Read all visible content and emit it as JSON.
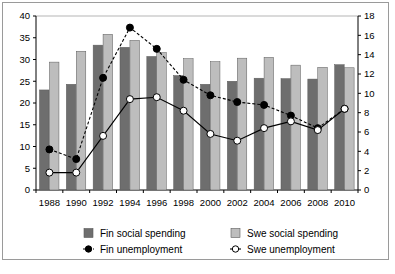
{
  "chart_data": {
    "type": "bar",
    "title": "",
    "subtitle": "",
    "xlabel": "",
    "ylabel": "",
    "y2label": "",
    "grid": false,
    "legend_position": "bottom",
    "categories": [
      "1988",
      "1990",
      "1992",
      "1994",
      "1996",
      "1998",
      "2000",
      "2002",
      "2004",
      "2006",
      "2008",
      "2010"
    ],
    "x_tick_labels": [
      "1988",
      "1990",
      "1992",
      "1994",
      "1996",
      "1998",
      "2000",
      "2002",
      "2004",
      "2006",
      "2008",
      "2010"
    ],
    "ylim": [
      0,
      40
    ],
    "y_ticks": [
      0,
      5,
      10,
      15,
      20,
      25,
      30,
      35,
      40
    ],
    "y_tick_labels": [
      "0",
      "5",
      "10",
      "15",
      "20",
      "25",
      "30",
      "35",
      "40"
    ],
    "y2lim": [
      0,
      18
    ],
    "y2_ticks": [
      0,
      2,
      4,
      6,
      8,
      10,
      12,
      14,
      16,
      18
    ],
    "y2_tick_labels": [
      "0",
      "2",
      "4",
      "6",
      "8",
      "10",
      "12",
      "14",
      "16",
      "18"
    ],
    "series": [
      {
        "name": "Fin social spending",
        "kind": "bar",
        "axis": "left",
        "color": "#6e6e6e",
        "values": [
          23.0,
          24.3,
          33.3,
          32.8,
          30.7,
          26.3,
          24.3,
          25.0,
          25.7,
          25.6,
          25.5,
          28.8
        ]
      },
      {
        "name": "Swe social spending",
        "kind": "bar",
        "axis": "left",
        "color": "#bdbdbd",
        "values": [
          29.4,
          31.9,
          35.8,
          34.4,
          31.6,
          30.2,
          29.5,
          30.3,
          30.5,
          28.7,
          28.2,
          28.1
        ]
      },
      {
        "name": "Fin unemployment",
        "kind": "line",
        "axis": "right",
        "color": "#000000",
        "marker": "filled-circle",
        "line_style": "dashed",
        "values": [
          4.2,
          3.2,
          11.6,
          16.8,
          14.6,
          11.4,
          9.8,
          9.1,
          8.8,
          7.7,
          6.4,
          8.4
        ]
      },
      {
        "name": "Swe unemployment",
        "kind": "line",
        "axis": "right",
        "color": "#ffffff",
        "marker": "open-circle",
        "line_style": "solid",
        "values": [
          1.8,
          1.8,
          5.6,
          9.4,
          9.6,
          8.2,
          5.8,
          5.1,
          6.4,
          7.1,
          6.2,
          8.4
        ]
      }
    ]
  },
  "legend": {
    "items": [
      {
        "label": "Fin social spending",
        "glyph": "bar-swatch-dark"
      },
      {
        "label": "Swe social spending",
        "glyph": "bar-swatch-light"
      },
      {
        "label": "Fin unemployment",
        "glyph": "line-filled-circle"
      },
      {
        "label": "Swe unemployment",
        "glyph": "line-open-circle"
      }
    ]
  },
  "colors": {
    "fin_bar": "#6e6e6e",
    "swe_bar": "#bdbdbd",
    "fin_line": "#000000",
    "swe_marker_fill": "#ffffff",
    "axis": "#000000",
    "frame": "#9a9a9a",
    "background": "#ffffff"
  }
}
